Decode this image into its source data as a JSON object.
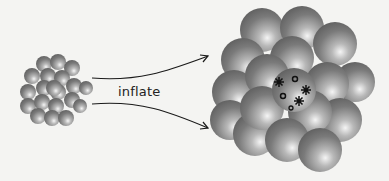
{
  "diagram": {
    "label": "inflate",
    "colors": {
      "background": "#f4f4f2",
      "sphere_dark": "#6e6e6e",
      "sphere_light": "#f2f2f2",
      "arrow": "#1a1a1a",
      "marks": "#111111"
    },
    "left_cluster": {
      "description": "small cluster of spheres (before)"
    },
    "right_cluster": {
      "description": "large cluster of inflated spheres (after)",
      "center_sphere_marks": {
        "stars": 3,
        "circles": 3
      }
    }
  }
}
